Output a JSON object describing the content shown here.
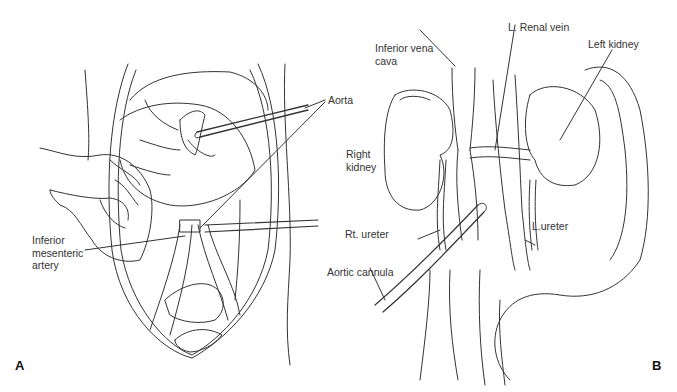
{
  "figure": {
    "panels": [
      {
        "id": "A",
        "letter": "A",
        "labels": {
          "aorta": "Aorta",
          "ima_line1": "Inferior",
          "ima_line2": "mesenteric",
          "ima_line3": "artery"
        }
      },
      {
        "id": "B",
        "letter": "B",
        "labels": {
          "ivc_line1": "Inferior vena",
          "ivc_line2": "cava",
          "renal_vein": "L. Renal vein",
          "left_kidney": "Left kidney",
          "right_kidney_line1": "Right",
          "right_kidney_line2": "kidney",
          "rt_ureter": "Rt. ureter",
          "l_ureter": "L.ureter",
          "aortic_cannula": "Aortic cannula"
        }
      }
    ],
    "colors": {
      "background": "#ffffff",
      "line": "#333333",
      "text": "#333333"
    }
  }
}
